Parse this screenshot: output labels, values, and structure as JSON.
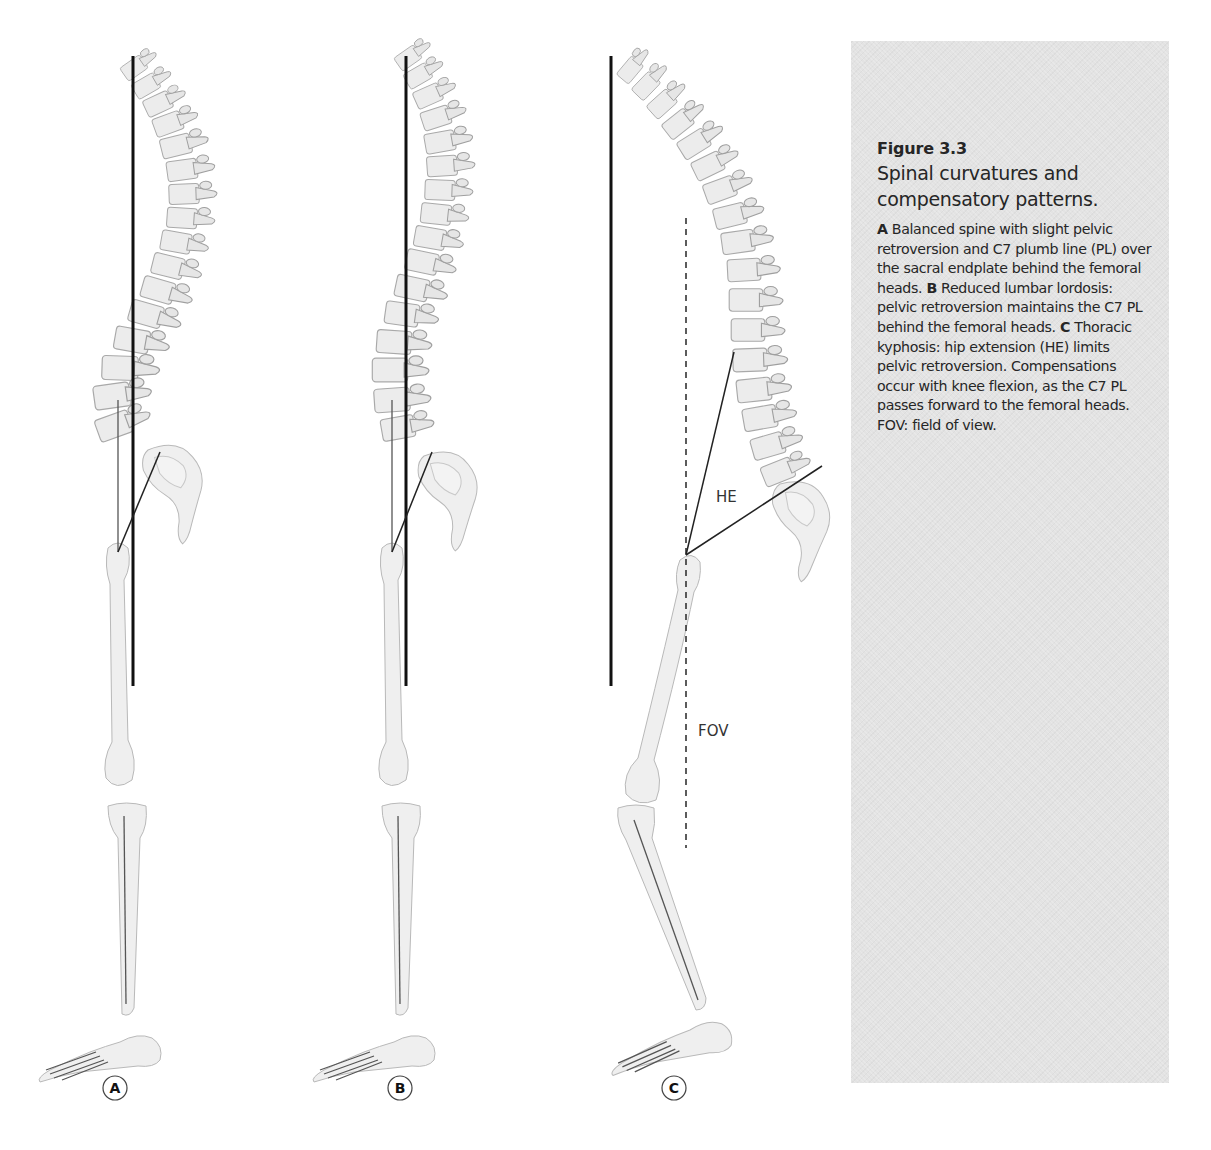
{
  "figure": {
    "number": "Figure 3.3",
    "title": "Spinal curvatures and compensatory patterns.",
    "caption": [
      {
        "label": "A",
        "text": " Balanced spine with slight pelvic retroversion and C7 plumb line (PL) over the sacral endplate behind the femoral heads. "
      },
      {
        "label": "B",
        "text": " Reduced lumbar lordosis: pelvic retroversion maintains the C7 PL behind the femoral heads. "
      },
      {
        "label": "C",
        "text": " Thoracic kyphosis: hip extension (HE) limits pelvic retroversion. Compensations occur with knee flexion, as the C7 PL passes forward to the femoral heads. FOV: field of view."
      }
    ]
  },
  "panels": [
    {
      "id": "A",
      "label": "A",
      "description": "Balanced spine"
    },
    {
      "id": "B",
      "label": "B",
      "description": "Reduced lumbar lordosis"
    },
    {
      "id": "C",
      "label": "C",
      "description": "Thoracic kyphosis",
      "annotations": {
        "hip_extension": "HE",
        "field_of_view": "FOV"
      }
    }
  ],
  "colors": {
    "caption_background": "#e3e3e3",
    "caption_text": "#262626",
    "plumb_line": "#111111",
    "bone": "#efefef"
  }
}
